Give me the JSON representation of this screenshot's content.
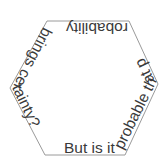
{
  "figure": {
    "shape": "hexagon",
    "vertices": [
      [
        47,
        21
      ],
      [
        129,
        21
      ],
      [
        158,
        84
      ],
      [
        125,
        155
      ],
      [
        45,
        155
      ],
      [
        10,
        88
      ]
    ],
    "stroke_color": "#9a9a9a",
    "fill_color": "#ffffff",
    "text_color": "#3a3a3a",
    "background": "#ffffff"
  },
  "ring_text": {
    "full": "But is it probable that probability brings certainty?",
    "segments": [
      {
        "edge": "bottom",
        "text": "But is it"
      },
      {
        "edge": "right",
        "text": "probable that p"
      },
      {
        "edge": "top",
        "text": "robability"
      },
      {
        "edge": "left",
        "text": "brings certainty?"
      }
    ]
  }
}
